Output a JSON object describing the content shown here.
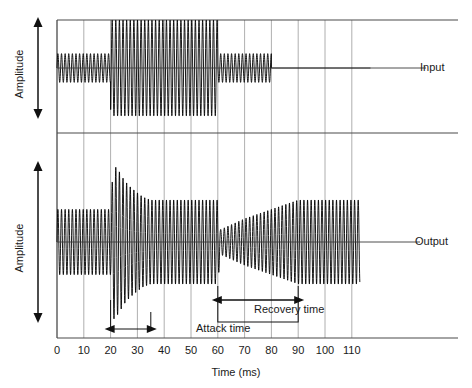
{
  "chart_data": {
    "type": "line",
    "title": "",
    "xlabel": "Time (ms)",
    "ylabel": "Amplitude",
    "xlim": [
      0,
      117
    ],
    "grid": true,
    "xticks": [
      0,
      10,
      20,
      30,
      40,
      50,
      60,
      70,
      80,
      90,
      100,
      110
    ],
    "xtick_labels": [
      "0",
      "10",
      "20",
      "30",
      "40",
      "50",
      "60",
      "70",
      "80",
      "90",
      "100",
      "110"
    ],
    "panels": [
      {
        "name": "Input",
        "label": "Input",
        "ylabel": "Amplitude",
        "description": "Sine carrier whose envelope steps from low to high level and back, then ends.",
        "carrier_period_ms": 1.35,
        "envelope_breakpoints": [
          {
            "t": 0,
            "amplitude": 0.3
          },
          {
            "t": 20,
            "amplitude": 0.3
          },
          {
            "t": 20,
            "amplitude": 1.0
          },
          {
            "t": 60,
            "amplitude": 1.0
          },
          {
            "t": 60,
            "amplitude": 0.3
          },
          {
            "t": 80,
            "amplitude": 0.3
          },
          {
            "t": 80,
            "amplitude": 0.0
          },
          {
            "t": 117,
            "amplitude": 0.0
          }
        ]
      },
      {
        "name": "Output",
        "label": "Output",
        "ylabel": "Amplitude",
        "description": "Compressed signal: overshoot transient at level step decays during attack time; level dip at level drop recovers gradually during recovery time.",
        "carrier_period_ms": 1.35,
        "envelope_breakpoints": [
          {
            "t": 0,
            "amplitude": 0.42
          },
          {
            "t": 20,
            "amplitude": 0.42
          },
          {
            "t": 21,
            "amplitude": 1.0
          },
          {
            "t": 23,
            "amplitude": 0.92
          },
          {
            "t": 25,
            "amplitude": 0.8
          },
          {
            "t": 27,
            "amplitude": 0.72
          },
          {
            "t": 29,
            "amplitude": 0.66
          },
          {
            "t": 32,
            "amplitude": 0.58
          },
          {
            "t": 35,
            "amplitude": 0.54
          },
          {
            "t": 60,
            "amplitude": 0.54
          },
          {
            "t": 61,
            "amplitude": 0.16
          },
          {
            "t": 70,
            "amplitude": 0.3
          },
          {
            "t": 80,
            "amplitude": 0.42
          },
          {
            "t": 90,
            "amplitude": 0.54
          },
          {
            "t": 113,
            "amplitude": 0.54
          },
          {
            "t": 113,
            "amplitude": 0.0
          }
        ]
      }
    ],
    "annotations": [
      {
        "id": "attack",
        "label": "Attack time",
        "t_start": 20,
        "t_end": 35,
        "style": "double-arrow"
      },
      {
        "id": "recovery",
        "label": "Recovery time",
        "t_start": 60,
        "t_end": 90,
        "style": "double-arrow-boxed"
      }
    ]
  },
  "axes": {
    "xlabel": "Time (ms)",
    "ylabel_input": "Amplitude",
    "ylabel_output": "Amplitude",
    "ticks": [
      "0",
      "10",
      "20",
      "30",
      "40",
      "50",
      "60",
      "70",
      "80",
      "90",
      "100",
      "110"
    ]
  },
  "labels": {
    "input": "Input",
    "output": "Output",
    "attack": "Attack time",
    "recovery": "Recovery time"
  },
  "colors": {
    "waveform": "#000000",
    "grid": "#9a9a9a",
    "axis": "#4a4a4a",
    "text": "#1a1a1a",
    "background": "#ffffff"
  }
}
